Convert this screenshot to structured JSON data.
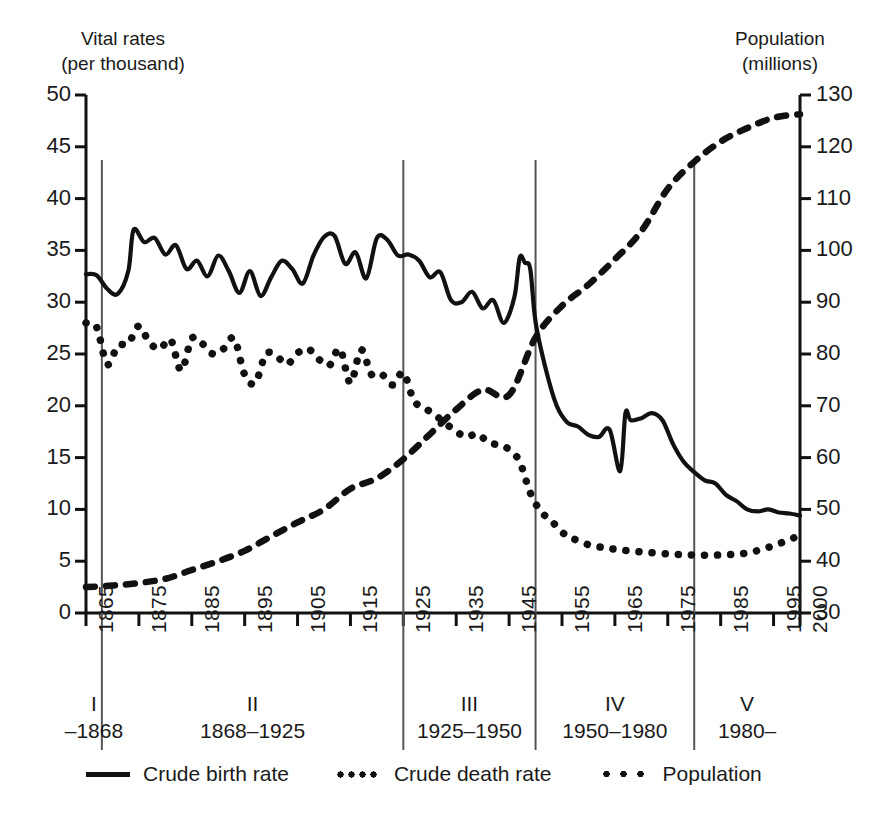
{
  "axes": {
    "left_title": "Vital rates\n(per thousand)",
    "right_title": "Population\n(millions)",
    "left_ticks": [
      "50",
      "45",
      "40",
      "35",
      "30",
      "25",
      "20",
      "15",
      "10",
      "5",
      "0"
    ],
    "right_ticks": [
      "130",
      "120",
      "110",
      "100",
      "90",
      "80",
      "70",
      "60",
      "50",
      "40",
      "30"
    ],
    "x_ticks": [
      "1865",
      "1875",
      "1885",
      "1895",
      "1905",
      "1915",
      "1925",
      "1935",
      "1945",
      "1955",
      "1965",
      "1975",
      "1985",
      "1995",
      "2000"
    ]
  },
  "periods": [
    {
      "numeral": "I",
      "range": "–1868"
    },
    {
      "numeral": "II",
      "range": "1868–1925"
    },
    {
      "numeral": "III",
      "range": "1925–1950"
    },
    {
      "numeral": "IV",
      "range": "1950–1980"
    },
    {
      "numeral": "V",
      "range": "1980–"
    }
  ],
  "legend": [
    {
      "label": "Crude birth rate",
      "style": "solid"
    },
    {
      "label": "Crude death rate",
      "style": "dense-dotted"
    },
    {
      "label": "Population",
      "style": "sparse-dashed"
    }
  ],
  "colors": {
    "ink": "#111111",
    "divider": "#555555",
    "background": "#ffffff"
  },
  "chart_data": {
    "type": "line",
    "title": "",
    "xlabel": "",
    "ylabel": "Vital rates (per thousand)",
    "y2label": "Population (millions)",
    "xlim": [
      1865,
      2000
    ],
    "ylim": [
      0,
      50
    ],
    "y2lim": [
      30,
      130
    ],
    "grid": false,
    "legend_position": "bottom",
    "period_dividers": [
      1868,
      1925,
      1950,
      1980
    ],
    "series": [
      {
        "name": "Crude birth rate",
        "axis": "left",
        "style": "solid",
        "x": [
          1865,
          1867,
          1869,
          1871,
          1873,
          1874,
          1876,
          1878,
          1880,
          1882,
          1884,
          1886,
          1888,
          1890,
          1892,
          1894,
          1896,
          1898,
          1900,
          1902,
          1904,
          1906,
          1908,
          1910,
          1912,
          1914,
          1916,
          1918,
          1920,
          1922,
          1924,
          1926,
          1928,
          1930,
          1932,
          1934,
          1936,
          1938,
          1940,
          1942,
          1944,
          1946,
          1947,
          1948,
          1949,
          1950,
          1952,
          1954,
          1956,
          1958,
          1960,
          1962,
          1964,
          1966,
          1967,
          1968,
          1970,
          1972,
          1974,
          1976,
          1978,
          1980,
          1982,
          1984,
          1986,
          1988,
          1990,
          1992,
          1994,
          1996,
          1998,
          2000
        ],
        "y": [
          32.7,
          32.6,
          31.3,
          30.8,
          33.0,
          37.0,
          35.8,
          36.2,
          34.6,
          35.5,
          33.2,
          34.0,
          32.5,
          34.5,
          33.0,
          30.9,
          33.0,
          30.6,
          32.4,
          34.0,
          33.2,
          31.8,
          34.5,
          36.3,
          36.4,
          33.7,
          34.8,
          32.3,
          36.2,
          36.0,
          34.5,
          34.6,
          34.0,
          32.4,
          32.9,
          30.2,
          30.0,
          31.0,
          29.4,
          30.2,
          28.0,
          30.5,
          34.3,
          33.8,
          33.2,
          28.1,
          23.4,
          20.0,
          18.4,
          18.0,
          17.2,
          17.0,
          17.7,
          13.7,
          19.3,
          18.6,
          18.8,
          19.3,
          18.6,
          16.3,
          14.6,
          13.6,
          12.8,
          12.5,
          11.4,
          10.8,
          10.0,
          9.8,
          10.0,
          9.7,
          9.6,
          9.4
        ]
      },
      {
        "name": "Crude death rate",
        "axis": "left",
        "style": "dense-dotted",
        "x": [
          1865,
          1867,
          1869,
          1871,
          1873,
          1875,
          1877,
          1879,
          1881,
          1883,
          1885,
          1887,
          1889,
          1891,
          1893,
          1895,
          1897,
          1899,
          1901,
          1903,
          1905,
          1907,
          1909,
          1911,
          1913,
          1915,
          1917,
          1919,
          1921,
          1923,
          1925,
          1927,
          1929,
          1931,
          1933,
          1935,
          1937,
          1939,
          1941,
          1943,
          1945,
          1947,
          1949,
          1951,
          1953,
          1955,
          1957,
          1960,
          1963,
          1966,
          1970,
          1975,
          1980,
          1985,
          1990,
          1995,
          2000
        ],
        "y": [
          28.0,
          27.6,
          24.0,
          25.8,
          26.0,
          27.7,
          26.1,
          25.5,
          26.4,
          23.4,
          26.5,
          26.0,
          25.0,
          25.5,
          26.5,
          23.0,
          22.2,
          25.0,
          24.8,
          24.0,
          25.1,
          25.5,
          24.5,
          23.9,
          25.5,
          22.2,
          25.4,
          23.0,
          23.0,
          22.0,
          23.2,
          20.5,
          19.8,
          19.1,
          18.3,
          17.5,
          17.0,
          17.3,
          16.5,
          16.2,
          15.8,
          14.6,
          11.6,
          9.8,
          8.9,
          7.8,
          7.2,
          6.6,
          6.3,
          6.1,
          5.9,
          5.7,
          5.6,
          5.6,
          5.8,
          6.5,
          7.5
        ]
      },
      {
        "name": "Population",
        "axis": "right",
        "style": "sparse-dashed",
        "x": [
          1865,
          1870,
          1875,
          1880,
          1885,
          1890,
          1895,
          1900,
          1905,
          1910,
          1915,
          1920,
          1925,
          1930,
          1935,
          1940,
          1945,
          1950,
          1955,
          1960,
          1965,
          1970,
          1975,
          1980,
          1985,
          1990,
          1995,
          2000
        ],
        "y": [
          35.0,
          35.3,
          35.8,
          36.6,
          38.3,
          40.0,
          42.0,
          44.8,
          47.5,
          50.0,
          54.0,
          56.0,
          59.7,
          64.5,
          69.3,
          73.1,
          72.1,
          83.2,
          89.3,
          93.4,
          98.3,
          103.7,
          111.9,
          117.1,
          121.0,
          123.6,
          125.6,
          126.3
        ]
      }
    ]
  }
}
